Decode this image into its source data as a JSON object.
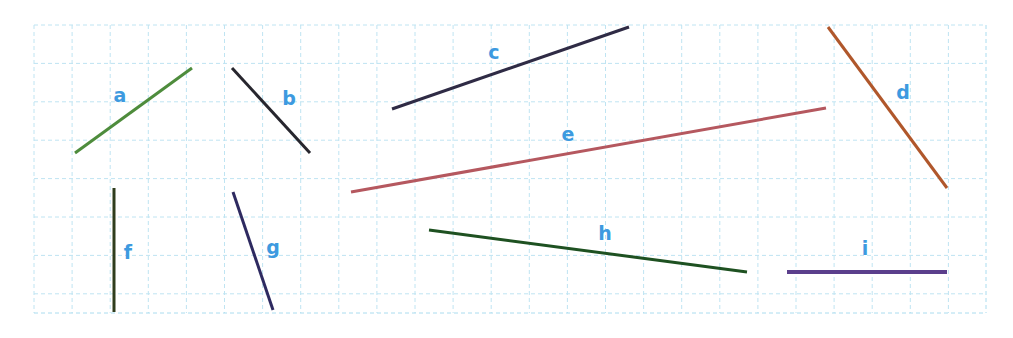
{
  "figure": {
    "width": 1013,
    "height": 338,
    "background": "#ffffff"
  },
  "grid": {
    "x_start": 34,
    "y_start": 25,
    "x_end": 986,
    "y_end": 313,
    "cell_width": 38.1,
    "cell_height": 38.4,
    "columns": 25,
    "rows": 7.5,
    "line_color": "#bfe4f2",
    "border_color": "#aadcef",
    "style": "dashed"
  },
  "label_style": {
    "color": "#3d9ae0",
    "font_size_px": 19,
    "font_weight": "bold"
  },
  "chart_data": {
    "type": "scatter",
    "xlabel": "",
    "ylabel": "",
    "segments": [
      {
        "label": "a",
        "color": "#4e8c3c",
        "width": 3,
        "x1": 75,
        "y1": 153,
        "x2": 192,
        "y2": 68,
        "label_x": 120,
        "label_y": 95
      },
      {
        "label": "b",
        "color": "#27262e",
        "width": 3,
        "x1": 232,
        "y1": 68,
        "x2": 310,
        "y2": 153,
        "label_x": 289,
        "label_y": 98
      },
      {
        "label": "c",
        "color": "#2f2b45",
        "width": 3,
        "x1": 392,
        "y1": 109,
        "x2": 629,
        "y2": 27,
        "label_x": 494,
        "label_y": 52
      },
      {
        "label": "d",
        "color": "#b0572b",
        "width": 3,
        "x1": 828,
        "y1": 27,
        "x2": 947,
        "y2": 188,
        "label_x": 903,
        "label_y": 92
      },
      {
        "label": "e",
        "color": "#b5585f",
        "width": 3,
        "x1": 351,
        "y1": 192,
        "x2": 826,
        "y2": 108,
        "label_x": 568,
        "label_y": 134
      },
      {
        "label": "f",
        "color": "#2f3d1d",
        "width": 3,
        "x1": 114,
        "y1": 188,
        "x2": 114,
        "y2": 312,
        "label_x": 128,
        "label_y": 252
      },
      {
        "label": "g",
        "color": "#2e2a60",
        "width": 3,
        "x1": 233,
        "y1": 192,
        "x2": 273,
        "y2": 310,
        "label_x": 273,
        "label_y": 247
      },
      {
        "label": "h",
        "color": "#1e5121",
        "width": 3,
        "x1": 429,
        "y1": 230,
        "x2": 747,
        "y2": 272,
        "label_x": 605,
        "label_y": 233
      },
      {
        "label": "i",
        "color": "#5b3f8c",
        "width": 4,
        "x1": 787,
        "y1": 272,
        "x2": 947,
        "y2": 272,
        "label_x": 865,
        "label_y": 248
      }
    ]
  }
}
